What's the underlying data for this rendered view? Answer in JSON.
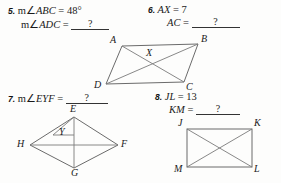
{
  "worksheet": {
    "problems": [
      {
        "number": "5.",
        "given": {
          "prefix": "m",
          "angle": "∠",
          "name": "ABC",
          "eq": "=",
          "value": "48°"
        },
        "find": {
          "prefix": "m",
          "angle": "∠",
          "name": "ADC",
          "eq": "=",
          "value": "?"
        },
        "figure": "parallelogram-abcd"
      },
      {
        "number": "6.",
        "given": {
          "prefix": "",
          "angle": "",
          "name": "AX",
          "eq": "=",
          "value": "7"
        },
        "find": {
          "prefix": "",
          "angle": "",
          "name": "AC",
          "eq": "=",
          "value": "?"
        },
        "figure": "parallelogram-abcd"
      },
      {
        "number": "7.",
        "given": null,
        "find": {
          "prefix": "m",
          "angle": "∠",
          "name": "EYF",
          "eq": "=",
          "value": "?"
        },
        "figure": "rhombus-efgh"
      },
      {
        "number": "8.",
        "given": {
          "prefix": "",
          "angle": "",
          "name": "JL",
          "eq": "=",
          "value": "13"
        },
        "find": {
          "prefix": "",
          "angle": "",
          "name": "KM",
          "eq": "=",
          "value": "?"
        },
        "figure": "rectangle-jklm"
      }
    ],
    "figures": {
      "parallelogram": {
        "name": "parallelogram-abcd",
        "vertices": [
          "A",
          "B",
          "C",
          "D"
        ],
        "intersection": "X",
        "diagonals": [
          "AC",
          "BD"
        ]
      },
      "rhombus": {
        "name": "rhombus-efgh",
        "vertices": [
          "E",
          "F",
          "G",
          "H"
        ],
        "intersection": "Y",
        "diagonals": [
          "EG",
          "HF"
        ]
      },
      "rectangle": {
        "name": "rectangle-jklm",
        "vertices": [
          "J",
          "K",
          "L",
          "M"
        ],
        "diagonals": [
          "JL",
          "KM"
        ]
      }
    },
    "colors": {
      "page_background": "#fdfdfc",
      "text": "#1a1a1a",
      "figure_stroke": "#6b6b6b",
      "blank_rule": "#333333"
    }
  }
}
